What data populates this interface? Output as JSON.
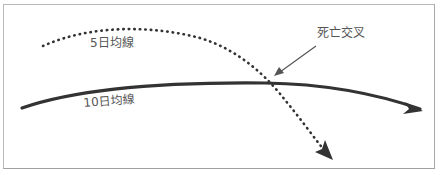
{
  "diagram": {
    "labels": {
      "ma5": "5日均線",
      "ma10": "10日均線",
      "cross": "死亡交叉"
    },
    "colors": {
      "line": "#333333",
      "text": "#555555",
      "border": "#b8b8b8"
    },
    "icons": {
      "ma5_arrowhead": "arrow-down-right-icon",
      "ma10_arrowhead": "arrow-right-icon",
      "pointer_arrow": "arrow-down-left-icon"
    }
  }
}
